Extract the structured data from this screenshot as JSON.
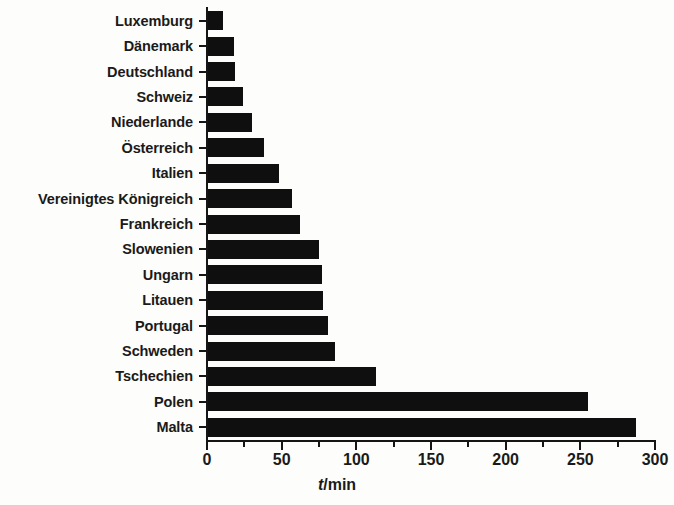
{
  "chart_data": {
    "type": "bar",
    "orientation": "horizontal",
    "title": "",
    "subtitle": "",
    "xlabel": "t/min",
    "xlabel_symbol": "t",
    "xlabel_unit": "/min",
    "ylabel": "",
    "categories": [
      "Luxemburg",
      "Dänemark",
      "Deutschland",
      "Schweiz",
      "Niederlande",
      "Österreich",
      "Italien",
      "Vereinigtes Königreich",
      "Frankreich",
      "Slowenien",
      "Ungarn",
      "Litauen",
      "Portugal",
      "Schweden",
      "Tschechien",
      "Polen",
      "Malta"
    ],
    "values": [
      11,
      18,
      19,
      24,
      30,
      38,
      48,
      57,
      62,
      75,
      77,
      78,
      81,
      86,
      113,
      255,
      287
    ],
    "xlim": [
      0,
      300
    ],
    "xticks": [
      0,
      50,
      100,
      150,
      200,
      250,
      300
    ],
    "xtick_labels": [
      "0",
      "50",
      "100",
      "150",
      "200",
      "250",
      "300"
    ],
    "xminor_ticks": [
      25,
      75,
      125,
      175,
      225,
      275
    ],
    "grid": false,
    "legend": false,
    "bar_color": "#100f0f",
    "background_color": "#fdfdfb",
    "axis_color": "#151515",
    "text_color": "#1a1a1a"
  }
}
